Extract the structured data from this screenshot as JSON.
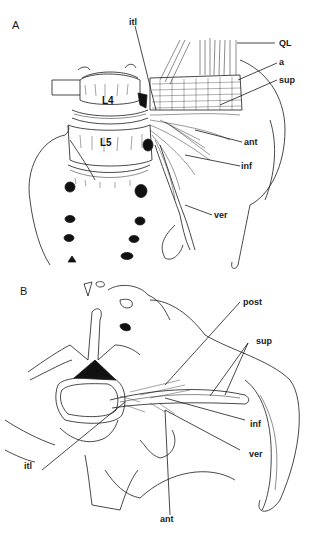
{
  "figure": {
    "panel_a": {
      "label": "A",
      "vertebrae": [
        "L4",
        "L5"
      ],
      "callouts": [
        {
          "id": "itl",
          "text": "itl"
        },
        {
          "id": "QL",
          "text": "QL"
        },
        {
          "id": "a",
          "text": "a"
        },
        {
          "id": "sup",
          "text": "sup"
        },
        {
          "id": "ant",
          "text": "ant"
        },
        {
          "id": "inf",
          "text": "inf"
        },
        {
          "id": "ver",
          "text": "ver"
        }
      ]
    },
    "panel_b": {
      "label": "B",
      "callouts": [
        {
          "id": "post",
          "text": "post"
        },
        {
          "id": "sup",
          "text": "sup"
        },
        {
          "id": "inf",
          "text": "inf"
        },
        {
          "id": "ver",
          "text": "ver"
        },
        {
          "id": "itl",
          "text": "itl"
        },
        {
          "id": "ant",
          "text": "ant"
        }
      ]
    },
    "colors": {
      "ink": "#1a1a1a",
      "background": "#ffffff"
    }
  }
}
